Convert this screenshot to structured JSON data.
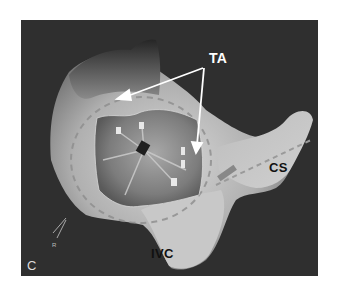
{
  "figure": {
    "panel_letter": "C",
    "labels": {
      "ta": "TA",
      "cs": "CS",
      "ivc": "IVC",
      "marker": "R"
    },
    "colors": {
      "background": "#2f2f2f",
      "surface_light": "#cfcfcf",
      "surface_mid": "#9a9a9a",
      "surface_dark": "#3a3a3a",
      "arrow": "#ffffff"
    }
  }
}
